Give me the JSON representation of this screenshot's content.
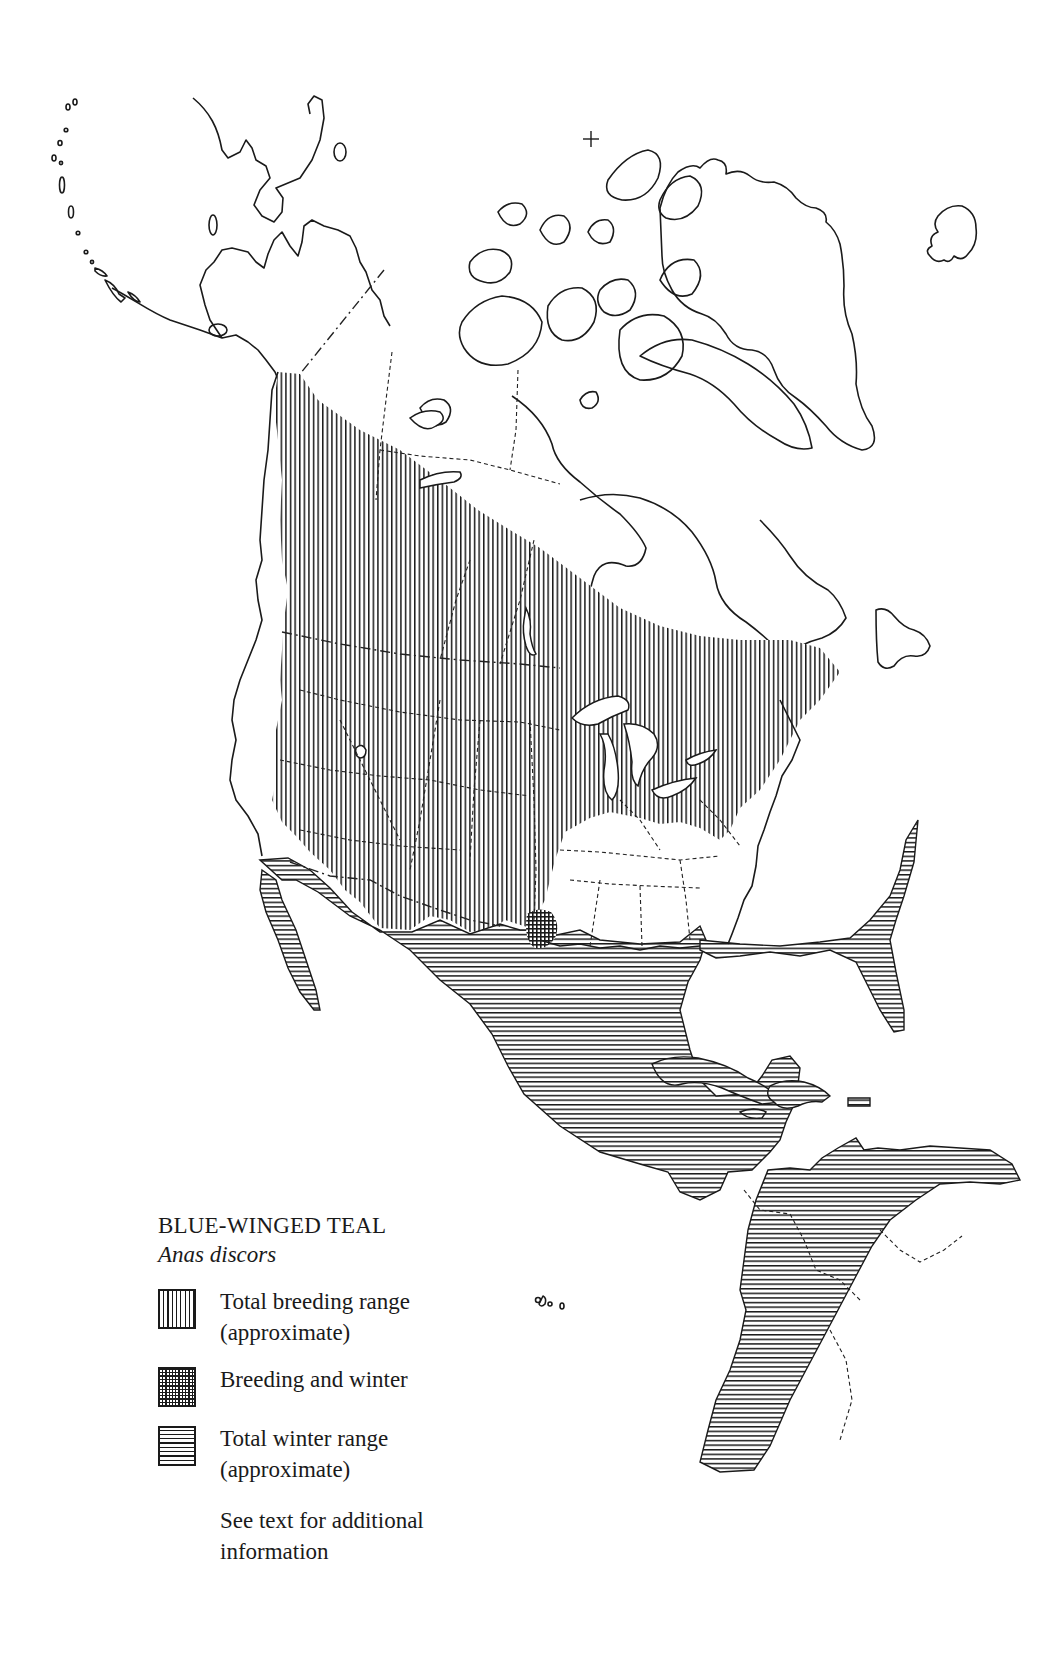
{
  "map": {
    "title": "BLUE-WINGED TEAL",
    "species_latin": "Anas discors",
    "region": "North America, Central America, Caribbean, northern South America",
    "north_pole_marker": "+",
    "pattern_colors": {
      "ink": "#1a1a1a",
      "paper": "#ffffff"
    }
  },
  "legend": {
    "title": "BLUE-WINGED TEAL",
    "subtitle": "Anas discors",
    "items": [
      {
        "pattern": "vertical-lines",
        "label_line1": "Total breeding range",
        "label_line2": "(approximate)"
      },
      {
        "pattern": "crosshatch",
        "label_line1": "Breeding and winter",
        "label_line2": ""
      },
      {
        "pattern": "horizontal-lines",
        "label_line1": "Total winter range",
        "label_line2": "(approximate)"
      }
    ],
    "note_line1": "See text for additional",
    "note_line2": "information"
  }
}
